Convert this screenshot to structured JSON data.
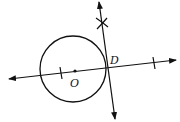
{
  "diagram": {
    "type": "geometric-construction",
    "colors": {
      "stroke": "#111111",
      "background": "#ffffff"
    },
    "circle": {
      "center_label": "O",
      "cx": 73,
      "cy": 69,
      "r": 33
    },
    "points": [
      {
        "label": "O",
        "x": 75,
        "y": 71
      },
      {
        "label": "D",
        "x": 107,
        "y": 67
      }
    ],
    "labels": {
      "O": "O",
      "D": "D"
    },
    "lines": [
      {
        "name": "line-OD",
        "x1": 9,
        "y1": 79,
        "x2": 176,
        "y2": 60,
        "arrows": "both"
      },
      {
        "name": "tangent-line",
        "x1": 99,
        "y1": 2,
        "x2": 115,
        "y2": 119,
        "arrows": "both"
      }
    ],
    "marks": [
      {
        "type": "tick",
        "x": 61,
        "y": 73
      },
      {
        "type": "tick",
        "x": 154,
        "y": 63
      },
      {
        "type": "arc-cross",
        "x": 102,
        "y": 24
      }
    ]
  }
}
